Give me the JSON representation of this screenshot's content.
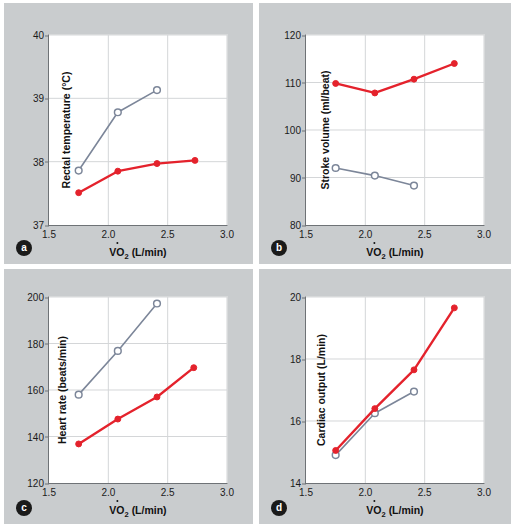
{
  "legend": {
    "entries": [
      {
        "label": "26 °C (78 °F)",
        "color": "#e4222c",
        "marker": "filled-circle"
      },
      {
        "label": "43 °C (110 °F)",
        "color": "#7c8699",
        "marker": "open-circle"
      }
    ]
  },
  "panels": {
    "a": {
      "badge": "a"
    },
    "b": {
      "badge": "b"
    },
    "c": {
      "badge": "c"
    },
    "d": {
      "badge": "d"
    }
  },
  "axis_common": {
    "xlabel_prefix": "VO",
    "xlabel_sub": "2",
    "xlabel_suffix": " (L/min)",
    "xticks": [
      "1.5",
      "2.0",
      "2.5",
      "3.0"
    ]
  },
  "chart_data": [
    {
      "panel": "a",
      "type": "line",
      "title": "",
      "xlabel": "VO2 (L/min)",
      "ylabel": "Rectal temperature (°C)",
      "xlim": [
        1.5,
        3.0
      ],
      "ylim": [
        37,
        40
      ],
      "xticks": [
        1.5,
        2.0,
        2.5,
        3.0
      ],
      "yticks": [
        37,
        38,
        39,
        40
      ],
      "grid": true,
      "legend_position": "above-figure",
      "series": [
        {
          "name": "26 °C (78 °F)",
          "color": "#e4222c",
          "marker": "filled-circle",
          "x": [
            1.75,
            2.08,
            2.41,
            2.73
          ],
          "values": [
            37.51,
            37.85,
            37.97,
            38.02
          ]
        },
        {
          "name": "43 °C (110 °F)",
          "color": "#7c8699",
          "marker": "open-circle",
          "x": [
            1.75,
            2.08,
            2.41
          ],
          "values": [
            37.86,
            38.78,
            39.13
          ]
        }
      ]
    },
    {
      "panel": "b",
      "type": "line",
      "title": "",
      "xlabel": "VO2 (L/min)",
      "ylabel": "Stroke volume (ml/beat)",
      "xlim": [
        1.5,
        3.0
      ],
      "ylim": [
        80,
        120
      ],
      "xticks": [
        1.5,
        2.0,
        2.5,
        3.0
      ],
      "yticks": [
        80,
        90,
        100,
        110,
        120
      ],
      "grid": true,
      "legend_position": "above-figure",
      "series": [
        {
          "name": "26 °C (78 °F)",
          "color": "#e4222c",
          "marker": "filled-circle",
          "x": [
            1.75,
            2.08,
            2.41,
            2.75
          ],
          "values": [
            109.8,
            107.8,
            110.7,
            114.0
          ]
        },
        {
          "name": "43 °C (110 °F)",
          "color": "#7c8699",
          "marker": "open-circle",
          "x": [
            1.75,
            2.08,
            2.41
          ],
          "values": [
            92.0,
            90.4,
            88.3
          ]
        }
      ]
    },
    {
      "panel": "c",
      "type": "line",
      "title": "",
      "xlabel": "VO2 (L/min)",
      "ylabel": "Heart rate (beats/min)",
      "xlim": [
        1.5,
        3.0
      ],
      "ylim": [
        120,
        200
      ],
      "xticks": [
        1.5,
        2.0,
        2.5,
        3.0
      ],
      "yticks": [
        120,
        140,
        160,
        180,
        200
      ],
      "grid": true,
      "legend_position": "above-figure",
      "series": [
        {
          "name": "26 °C (78 °F)",
          "color": "#e4222c",
          "marker": "filled-circle",
          "x": [
            1.75,
            2.08,
            2.41,
            2.72
          ],
          "values": [
            136.8,
            147.5,
            157.0,
            169.6
          ]
        },
        {
          "name": "43 °C (110 °F)",
          "color": "#7c8699",
          "marker": "open-circle",
          "x": [
            1.75,
            2.08,
            2.41
          ],
          "values": [
            158.0,
            176.8,
            197.2
          ]
        }
      ]
    },
    {
      "panel": "d",
      "type": "line",
      "title": "",
      "xlabel": "VO2 (L/min)",
      "ylabel": "Cardiac output (L/min)",
      "xlim": [
        1.5,
        3.0
      ],
      "ylim": [
        14,
        20
      ],
      "xticks": [
        1.5,
        2.0,
        2.5,
        3.0
      ],
      "yticks": [
        14,
        16,
        18,
        20
      ],
      "grid": true,
      "legend_position": "above-figure",
      "series": [
        {
          "name": "26 °C (78 °F)",
          "color": "#e4222c",
          "marker": "filled-circle",
          "x": [
            1.75,
            2.08,
            2.41,
            2.75
          ],
          "values": [
            15.05,
            16.4,
            17.65,
            19.65
          ]
        },
        {
          "name": "43 °C (110 °F)",
          "color": "#7c8699",
          "marker": "open-circle",
          "x": [
            1.75,
            2.08,
            2.41
          ],
          "values": [
            14.9,
            16.25,
            16.95
          ]
        }
      ]
    }
  ]
}
